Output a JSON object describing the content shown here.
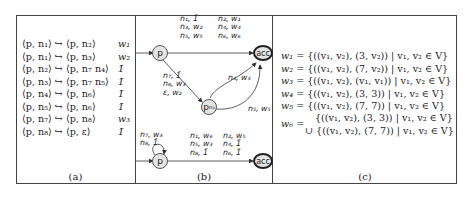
{
  "panel_a": {
    "caption": "(a)",
    "rules": [
      {
        "lhs": "⟨p, n₁⟩ ↪ ⟨p, n₂⟩",
        "weight": "w₁"
      },
      {
        "lhs": "⟨p, n₁⟩ ↪ ⟨p, n₃⟩",
        "weight": "w₂"
      },
      {
        "lhs": "⟨p, n₂⟩ ↪ ⟨p, n₇ n₄⟩",
        "weight": "1̄"
      },
      {
        "lhs": "⟨p, n₃⟩ ↪ ⟨p, n₇ n₅⟩",
        "weight": "1̄"
      },
      {
        "lhs": "⟨p, n₄⟩ ↪ ⟨p, n₆⟩",
        "weight": "1̄"
      },
      {
        "lhs": "⟨p, n₅⟩ ↪ ⟨p, n₆⟩",
        "weight": "1̄"
      },
      {
        "lhs": "⟨p, n₇⟩ ↪ ⟨p, n₈⟩",
        "weight": "w₃"
      },
      {
        "lhs": "⟨p, n₈⟩ ↪ ⟨p, ε⟩",
        "weight": "1̄"
      }
    ]
  },
  "panel_b": {
    "caption": "(b)",
    "top_automaton": {
      "nodes": {
        "p": "p",
        "pn4": "p",
        "pn4_sub": "n₄",
        "acc": "acc"
      },
      "edge_p_acc_label_1": [
        "n₁, 1̄",
        "n₃, w₂",
        "n₅, w₅"
      ],
      "edge_p_acc_label_2": [
        "n₂, w₁",
        "n₄, w₄",
        "n₆, w₆"
      ],
      "edge_p_pn4_label": [
        "n₇, 1̄",
        "n₈, w₃",
        "ε, w₂"
      ],
      "edge_pn4_acc_upper_label": "n₄, w₄",
      "edge_pn4_acc_lower_label": "n₅, w₅"
    },
    "bottom_automaton": {
      "nodes": {
        "p": "p",
        "acc": "acc"
      },
      "self_loop_label": [
        "n₇, w₃",
        "n₈, 1̄"
      ],
      "edge_p_acc_label_1": [
        "n₁, w₆",
        "n₅, w₃",
        "n₈, 1̄"
      ],
      "edge_p_acc_label_2": [
        "n₂, w₅",
        "n₄, 1̄",
        "n₆, 1̄"
      ]
    }
  },
  "panel_c": {
    "caption": "(c)",
    "equations": [
      {
        "lhs": "w₁",
        "rhs": "= {((v₁, v₂), (3, v₂)) | v₁, v₂ ∈ V}"
      },
      {
        "lhs": "w₂",
        "rhs": "= {((v₁, v₂), (7, v₂)) | v₁, v₂ ∈ V}"
      },
      {
        "lhs": "w₃",
        "rhs": "= {((v₁, v₂), (v₁, v₁)) | v₁, v₂ ∈ V}"
      },
      {
        "lhs": "w₄",
        "rhs": "= {((v₁, v₂), (3, 3)) | v₁, v₂ ∈ V}"
      },
      {
        "lhs": "w₅",
        "rhs": "= {((v₁, v₂), (7, 7)) | v₁, v₂ ∈ V}"
      },
      {
        "lhs": "w₆",
        "rhs": "="
      },
      {
        "lhs": "",
        "rhs": "{((v₁, v₂), (3, 3)) | v₁, v₂ ∈ V}"
      },
      {
        "lhs": "",
        "rhs": "∪ {((v₁, v₂), (7, 7)) | v₁, v₂ ∈ V}"
      }
    ]
  }
}
